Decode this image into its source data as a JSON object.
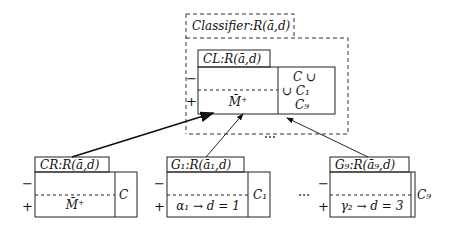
{
  "classifier": {
    "title": "Classifier:R(ā,d)",
    "cl_box": {
      "title": "CL:R(ā,d)",
      "minus": "−",
      "plus": "+",
      "content": "M̄⁺",
      "side_top": "C ∪",
      "side_mid": "∪ C₁",
      "side_bot": "C₉",
      "dots": "⋯"
    }
  },
  "boxes": [
    {
      "title": "CR:R(ā,d)",
      "minus": "−",
      "plus": "+",
      "content": "M̄⁺",
      "side": "C"
    },
    {
      "title": "G₁:R(ā₁,d)",
      "minus": "−",
      "plus": "+",
      "content": "α₁ → d = 1",
      "side": "C₁"
    },
    {
      "title": "G₉:R(ā₉,d)",
      "minus": "−",
      "plus": "+",
      "content": "γ₂ → d = 3",
      "side": "C₉"
    }
  ],
  "ellipsis_between": "⋯"
}
